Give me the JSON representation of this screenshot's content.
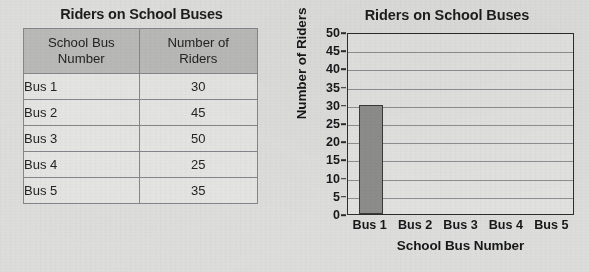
{
  "table_panel": {
    "title": "Riders on School Buses",
    "columns": [
      "School Bus Number",
      "Number of Riders"
    ],
    "column_lines": [
      [
        "School Bus",
        "Number"
      ],
      [
        "Number of",
        "Riders"
      ]
    ],
    "rows": [
      {
        "bus": "Bus 1",
        "riders": "30"
      },
      {
        "bus": "Bus 2",
        "riders": "45"
      },
      {
        "bus": "Bus 3",
        "riders": "50"
      },
      {
        "bus": "Bus 4",
        "riders": "25"
      },
      {
        "bus": "Bus 5",
        "riders": "35"
      }
    ],
    "header_fill": "#b9b9b8",
    "border_color": "#5b5b5b"
  },
  "chart_panel": {
    "title": "Riders on School Buses",
    "ylabel": "Number of Riders",
    "xlabel": "School Bus Number"
  },
  "chart_data": {
    "type": "bar",
    "title": "Riders on School Buses",
    "xlabel": "School Bus Number",
    "ylabel": "Number of Riders",
    "categories": [
      "Bus 1",
      "Bus 2",
      "Bus 3",
      "Bus 4",
      "Bus 5"
    ],
    "values": [
      30,
      null,
      null,
      null,
      null
    ],
    "ylim": [
      0,
      50
    ],
    "ytick_labels": [
      "50",
      "45",
      "40",
      "35",
      "30",
      "25",
      "20",
      "15",
      "10",
      "5",
      "0"
    ],
    "ytick_values": [
      50,
      45,
      40,
      35,
      30,
      25,
      20,
      15,
      10,
      5,
      0
    ],
    "ytick_interval": 5,
    "grid": "horizontal",
    "legend": "none",
    "bar_fill": "#8d8d8c",
    "bar_edge": "#3a3a3a",
    "plot_bg": "#e2e2e1",
    "axis_color": "#2c2c2c",
    "note": "Only the Bus 1 bar is drawn; bars for Bus 2 through Bus 5 are blank (incomplete graph)."
  }
}
